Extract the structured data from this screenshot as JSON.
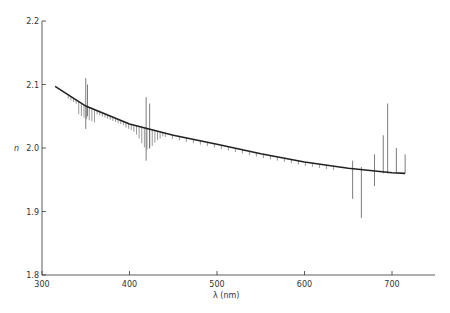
{
  "chart_data": {
    "type": "line",
    "title": "",
    "xlabel": "λ (nm)",
    "ylabel": "n",
    "xlim": [
      300,
      750
    ],
    "ylim": [
      1.8,
      2.2
    ],
    "xticks": [
      300,
      400,
      500,
      600,
      700
    ],
    "yticks": [
      1.8,
      1.9,
      2.0,
      2.1,
      2.2
    ],
    "xtick_labels": [
      "300",
      "400",
      "500",
      "600",
      "700"
    ],
    "ytick_labels": [
      "1.8",
      "1.9",
      "2.0",
      "2.1",
      "2.2"
    ],
    "grid": false,
    "legend": null,
    "series": [
      {
        "name": "fitted dispersion curve",
        "x": [
          315,
          350,
          400,
          450,
          500,
          550,
          600,
          650,
          700,
          715
        ],
        "y": [
          2.097,
          2.066,
          2.038,
          2.02,
          2.006,
          1.991,
          1.978,
          1.968,
          1.961,
          1.96
        ]
      }
    ],
    "error_bars": [
      {
        "x": 350,
        "low": 2.03,
        "high": 2.11
      },
      {
        "x": 352,
        "low": 2.05,
        "high": 2.1
      },
      {
        "x": 419,
        "low": 1.98,
        "high": 2.08
      },
      {
        "x": 423,
        "low": 2.0,
        "high": 2.07
      },
      {
        "x": 655,
        "low": 1.92,
        "high": 1.98
      },
      {
        "x": 665,
        "low": 1.89,
        "high": 1.97
      },
      {
        "x": 680,
        "low": 1.94,
        "high": 1.99
      },
      {
        "x": 690,
        "low": 1.96,
        "high": 2.02
      },
      {
        "x": 695,
        "low": 1.96,
        "high": 2.07
      },
      {
        "x": 705,
        "low": 1.96,
        "high": 2.0
      },
      {
        "x": 715,
        "low": 1.96,
        "high": 1.99
      }
    ]
  },
  "axes": {
    "xlabel": "λ (nm)",
    "ylabel": "n",
    "xticks": [
      "300",
      "400",
      "500",
      "600",
      "700"
    ],
    "yticks": [
      "2.2",
      "2.1",
      "2.0",
      "1.9",
      "1.8"
    ]
  }
}
